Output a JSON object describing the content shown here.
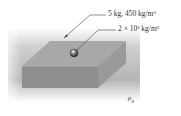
{
  "figure": {
    "labels": {
      "block": "5 kg, 450 kg/m³",
      "sphere": "2 × 10³ kg/m³",
      "fluid_density": "ρ",
      "fluid_density_sub": "g"
    }
  },
  "colors": {
    "top_face": "#a9a9a9",
    "front_face": "#8e8e8e",
    "side_face": "#9b9b9b",
    "background_shade": "#c8c8c8",
    "sphere": "#5a5a5a"
  }
}
